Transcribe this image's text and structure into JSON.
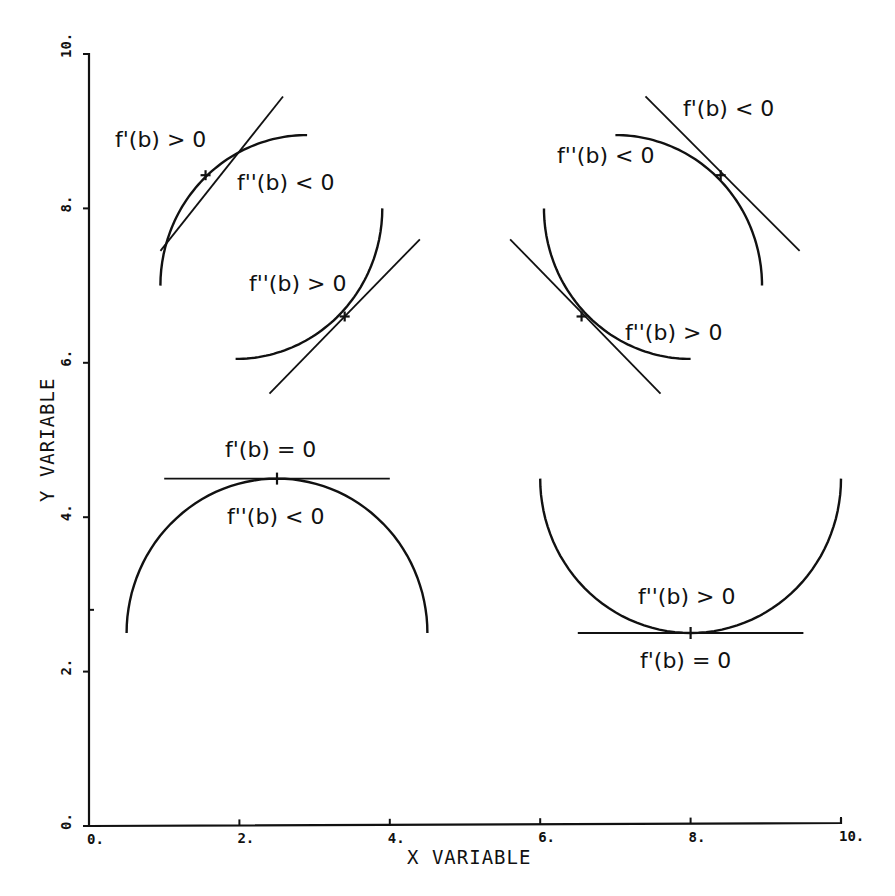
{
  "chart_data": {
    "type": "line",
    "title": "",
    "xlabel": "X VARIABLE",
    "ylabel": "Y VARIABLE",
    "xlim": [
      0,
      10
    ],
    "ylim": [
      0,
      10
    ],
    "grid": false,
    "legend": null,
    "x_ticks": [
      {
        "value": 0,
        "label": "0."
      },
      {
        "value": 2,
        "label": "2."
      },
      {
        "value": 4,
        "label": "4."
      },
      {
        "value": 6,
        "label": "6."
      },
      {
        "value": 8,
        "label": "8."
      },
      {
        "value": 10,
        "label": "10."
      }
    ],
    "y_ticks": [
      {
        "value": 0,
        "label": "0."
      },
      {
        "value": 2,
        "label": "2."
      },
      {
        "value": 4,
        "label": "4."
      },
      {
        "value": 6,
        "label": "6."
      },
      {
        "value": 8,
        "label": "8."
      },
      {
        "value": 10,
        "label": "10."
      }
    ],
    "y_minor_ticks": [
      2.8
    ],
    "series": [
      {
        "name": "concave-increasing",
        "description": "quarter circle, f'(b) > 0, f''(b) < 0",
        "arc": {
          "cx": 2.9,
          "cy": 7.0,
          "r": 1.95,
          "from_deg": 180,
          "to_deg": 90
        },
        "point": {
          "x": 1.55,
          "y": 8.43
        },
        "tangent": {
          "x1": 0.95,
          "y1": 7.45,
          "x2": 2.58,
          "y2": 9.45
        }
      },
      {
        "name": "convex-increasing",
        "description": "quarter circle, f''(b) > 0",
        "arc": {
          "cx": 1.95,
          "cy": 8.0,
          "r": 1.95,
          "from_deg": 270,
          "to_deg": 360
        },
        "point": {
          "x": 3.4,
          "y": 6.6
        },
        "tangent": {
          "x1": 2.4,
          "y1": 5.6,
          "x2": 4.4,
          "y2": 7.6
        }
      },
      {
        "name": "concave-decreasing",
        "description": "quarter circle, f'(b) < 0, f''(b) < 0",
        "arc": {
          "cx": 7.0,
          "cy": 7.0,
          "r": 1.95,
          "from_deg": 90,
          "to_deg": 0
        },
        "point": {
          "x": 8.4,
          "y": 8.43
        },
        "tangent": {
          "x1": 7.4,
          "y1": 9.45,
          "x2": 9.45,
          "y2": 7.45
        }
      },
      {
        "name": "convex-decreasing",
        "description": "quarter circle, f''(b) > 0",
        "arc": {
          "cx": 8.0,
          "cy": 8.0,
          "r": 1.95,
          "from_deg": 180,
          "to_deg": 270
        },
        "point": {
          "x": 6.55,
          "y": 6.6
        },
        "tangent": {
          "x1": 5.6,
          "y1": 7.6,
          "x2": 7.6,
          "y2": 5.6
        }
      },
      {
        "name": "maximum",
        "description": "semicircle, f'(b) = 0, f''(b) < 0",
        "arc": {
          "cx": 2.5,
          "cy": 2.5,
          "r": 2.0,
          "from_deg": 180,
          "to_deg": 0,
          "upper": true
        },
        "point": {
          "x": 2.5,
          "y": 4.5
        },
        "tangent": {
          "x1": 1.0,
          "y1": 4.5,
          "x2": 4.0,
          "y2": 4.5
        }
      },
      {
        "name": "minimum",
        "description": "semicircle, f'(b) = 0, f''(b) > 0",
        "arc": {
          "cx": 8.0,
          "cy": 4.5,
          "r": 2.0,
          "from_deg": 180,
          "to_deg": 360,
          "upper": false
        },
        "point": {
          "x": 8.0,
          "y": 2.5
        },
        "tangent": {
          "x1": 6.5,
          "y1": 2.5,
          "x2": 9.5,
          "y2": 2.5
        }
      }
    ],
    "annotations": [
      {
        "text": "f'(b) > 0",
        "px": 115,
        "py": 147
      },
      {
        "text": "f''(b) < 0",
        "px": 237,
        "py": 190
      },
      {
        "text": "f''(b) > 0",
        "px": 249,
        "py": 291
      },
      {
        "text": "f'(b) < 0",
        "px": 683,
        "py": 116
      },
      {
        "text": "f''(b) < 0",
        "px": 557,
        "py": 163
      },
      {
        "text": "f''(b) > 0",
        "px": 625,
        "py": 340
      },
      {
        "text": "f'(b) = 0",
        "px": 225,
        "py": 457
      },
      {
        "text": "f''(b) < 0",
        "px": 227,
        "py": 524
      },
      {
        "text": "f''(b) > 0",
        "px": 638,
        "py": 604
      },
      {
        "text": "f'(b) = 0",
        "px": 640,
        "py": 668
      }
    ]
  },
  "layout": {
    "plot_left_px": 89,
    "plot_right_px": 841,
    "plot_top_px": 54,
    "plot_bottom_px": 826
  }
}
